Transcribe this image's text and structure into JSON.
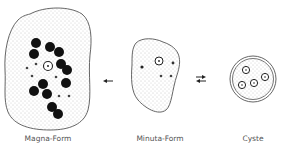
{
  "figure": {
    "stages": [
      {
        "id": "magna",
        "label": "Magna-Form"
      },
      {
        "id": "minuta",
        "label": "Minuta-Form"
      },
      {
        "id": "cyste",
        "label": "Cyste"
      }
    ],
    "arrows": [
      {
        "from": "minuta",
        "to": "magna",
        "type": "single"
      },
      {
        "from": "minuta",
        "to": "cyste",
        "type": "reversible"
      }
    ],
    "magna_annotation": "",
    "colors": {
      "outline": "#555555",
      "stipple": "#9a9a9a",
      "inclusion": "#111111",
      "text": "#555555"
    }
  }
}
